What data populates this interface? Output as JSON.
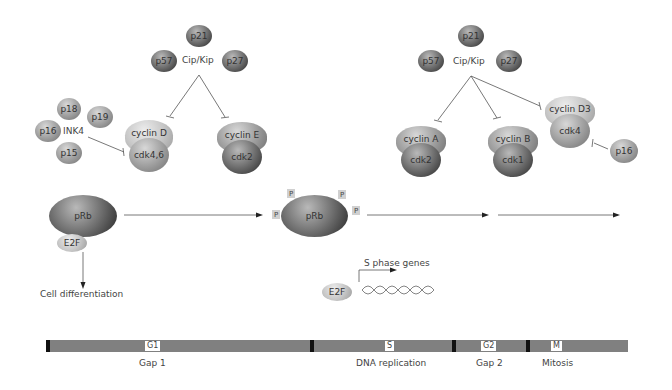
{
  "left_group": {
    "cipkip": {
      "label": "Cip/Kip",
      "members": [
        "p21",
        "p57",
        "p27"
      ]
    },
    "ink4": {
      "label": "INK4",
      "members": [
        "p18",
        "p19",
        "p16",
        "p15"
      ]
    },
    "complexes": [
      {
        "cyclin": "cyclin D",
        "cdk": "cdk4,6"
      },
      {
        "cyclin": "cyclin E",
        "cdk": "cdk2"
      }
    ]
  },
  "right_group": {
    "cipkip": {
      "label": "Cip/Kip",
      "members": [
        "p21",
        "p57",
        "p27"
      ]
    },
    "complexes": [
      {
        "cyclin": "cyclin A",
        "cdk": "cdk2"
      },
      {
        "cyclin": "cyclin B",
        "cdk": "cdk1"
      },
      {
        "cyclin": "cyclin D3",
        "cdk": "cdk4"
      }
    ],
    "inhibitor": "p16"
  },
  "prb": {
    "unphosphorylated": {
      "label": "pRb",
      "partner": "E2F"
    },
    "phosphorylated": {
      "label": "pRb",
      "phospho": [
        "P",
        "P",
        "P",
        "P"
      ]
    }
  },
  "outcomes": {
    "differentiation": "Cell differentiation",
    "s_phase": "S phase genes",
    "e2f": "E2F"
  },
  "cell_cycle": {
    "phases": [
      {
        "code": "G1",
        "name": "Gap 1"
      },
      {
        "code": "S",
        "name": "DNA replication"
      },
      {
        "code": "G2",
        "name": "Gap 2"
      },
      {
        "code": "M",
        "name": "Mitosis"
      }
    ]
  }
}
